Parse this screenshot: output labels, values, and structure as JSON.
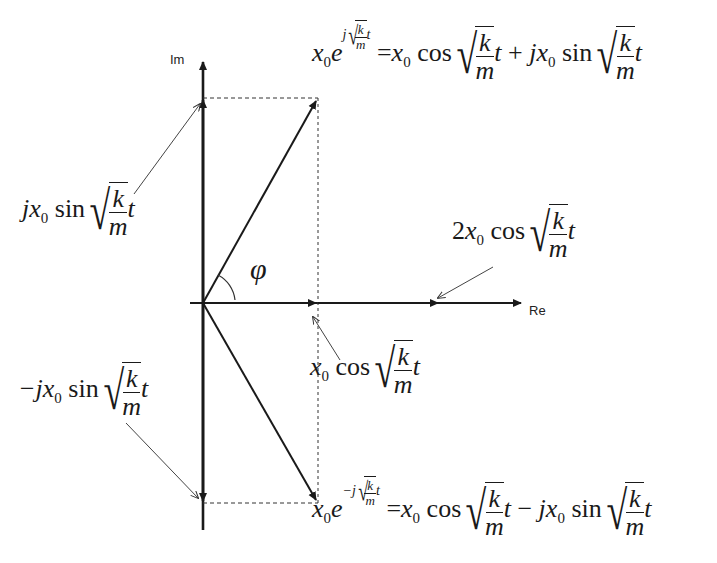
{
  "axes": {
    "im_label": "Im",
    "re_label": "Re",
    "origin": [
      203,
      303
    ],
    "im_axis_top": 58,
    "im_axis_bottom": 530,
    "re_axis_left": 190,
    "re_axis_right": 523
  },
  "vectors": {
    "positive_phasor_tip": [
      318,
      98
    ],
    "negative_phasor_tip": [
      318,
      503
    ],
    "real_projection_tip": [
      318,
      303
    ],
    "sum_tip": [
      440,
      303
    ]
  },
  "angle_label": "φ",
  "labels": {
    "top_equation": {
      "lhs_base": "x",
      "lhs_sub": "0",
      "lhs_e": "e",
      "exp_j": "j",
      "exp_num": "k",
      "exp_den": "m",
      "exp_t": "t",
      "equals": "=",
      "term1_base": "x",
      "term1_sub": "0",
      "term1_fn": "cos",
      "term1_num": "k",
      "term1_den": "m",
      "term1_t": "t",
      "op": "+",
      "term2_j": "j",
      "term2_base": "x",
      "term2_sub": "0",
      "term2_fn": "sin",
      "term2_num": "k",
      "term2_den": "m",
      "term2_t": "t"
    },
    "bottom_equation": {
      "lhs_base": "x",
      "lhs_sub": "0",
      "lhs_e": "e",
      "exp_j": "−j",
      "exp_num": "k",
      "exp_den": "m",
      "exp_t": "t",
      "equals": "=",
      "term1_base": "x",
      "term1_sub": "0",
      "term1_fn": "cos",
      "term1_num": "k",
      "term1_den": "m",
      "term1_t": "t",
      "op": "−",
      "term2_j": "j",
      "term2_base": "x",
      "term2_sub": "0",
      "term2_fn": "sin",
      "term2_num": "k",
      "term2_den": "m",
      "term2_t": "t"
    },
    "im_positive": {
      "j": "j",
      "base": "x",
      "sub": "0",
      "fn": "sin",
      "num": "k",
      "den": "m",
      "t": "t"
    },
    "im_negative": {
      "j": "−j",
      "base": "x",
      "sub": "0",
      "fn": "sin",
      "num": "k",
      "den": "m",
      "t": "t"
    },
    "re_projection": {
      "base": "x",
      "sub": "0",
      "fn": "cos",
      "num": "k",
      "den": "m",
      "t": "t"
    },
    "re_sum": {
      "coef": "2",
      "base": "x",
      "sub": "0",
      "fn": "cos",
      "num": "k",
      "den": "m",
      "t": "t"
    }
  }
}
